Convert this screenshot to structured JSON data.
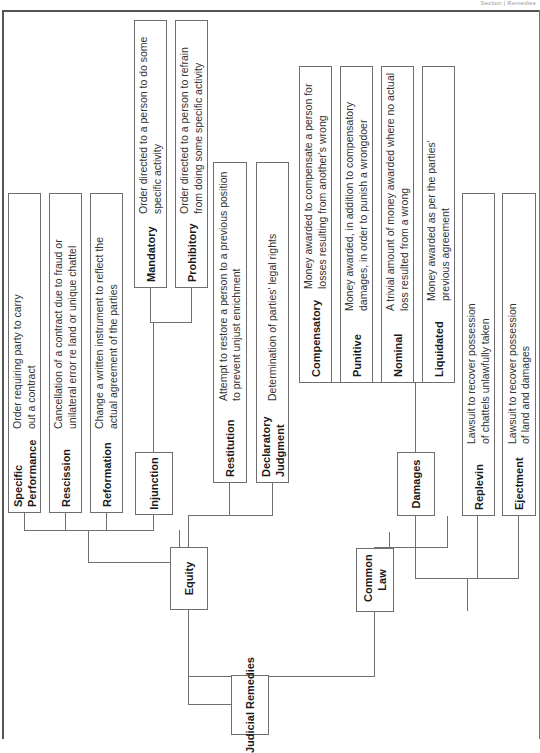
{
  "running_head": "Section | Remedies",
  "root": {
    "label": "Judicial Remedies"
  },
  "equity": {
    "label": "Equity",
    "children": [
      {
        "label": "Specific Performance",
        "description": "Order requiring party to carry out a contract"
      },
      {
        "label": "Rescission",
        "description": "Cancellation of a contract due to fraud or unilateral error re land or unique chattel"
      },
      {
        "label": "Reformation",
        "description": "Change a written instrument to reflect the actual agreement of the parties"
      },
      {
        "label": "Injunction",
        "children": [
          {
            "label": "Mandatory",
            "description": "Order directed to a person to do some specific activity"
          },
          {
            "label": "Prohibitory",
            "description": "Order directed to a person to refrain from doing some specific activity"
          }
        ]
      },
      {
        "label": "Restitution",
        "description": "Attempt to restore a person to a previous position to prevent unjust enrichment"
      },
      {
        "label": "Declaratory Judgment",
        "description": "Determination of parties' legal rights"
      }
    ]
  },
  "common_law": {
    "label": "Common Law",
    "children": [
      {
        "label": "Damages",
        "children": [
          {
            "label": "Compensatory",
            "description": "Money awarded to compensate a person for losses resulting from another's wrong"
          },
          {
            "label": "Punitive",
            "description": "Money awarded, in addition to compensatory damages, in order to punish a wrongdoer"
          },
          {
            "label": "Nominal",
            "description": "A trivial amount of money awarded where no actual loss resulted from a wrong"
          },
          {
            "label": "Liquidated",
            "description": "Money awarded as per the parties' previous agreement"
          }
        ]
      },
      {
        "label": "Replevin",
        "description": "Lawsuit to recover possession of chattels unlawfully taken"
      },
      {
        "label": "Ejectment",
        "description": "Lawsuit to recover possession of land and damages"
      }
    ]
  },
  "colors": {
    "border": "#6e6e6e",
    "connector": "#707070",
    "text": "#1a1a1a",
    "frame": "#555555"
  }
}
